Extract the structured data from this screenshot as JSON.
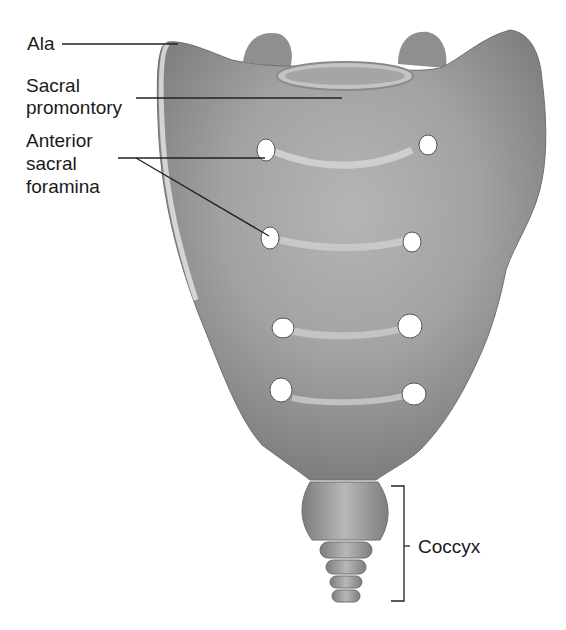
{
  "labels": {
    "ala": "Ala",
    "sacral_promontory_1": "Sacral",
    "sacral_promontory_2": "promontory",
    "anterior_foramina_1": "Anterior",
    "anterior_foramina_2": "sacral",
    "anterior_foramina_3": "foramina",
    "coccyx": "Coccyx"
  },
  "colors": {
    "background": "#ffffff",
    "bone_light": "#d4d4d4",
    "bone_mid": "#a8a8a8",
    "bone_dark": "#7a7a7a",
    "leader_line": "#222222"
  }
}
